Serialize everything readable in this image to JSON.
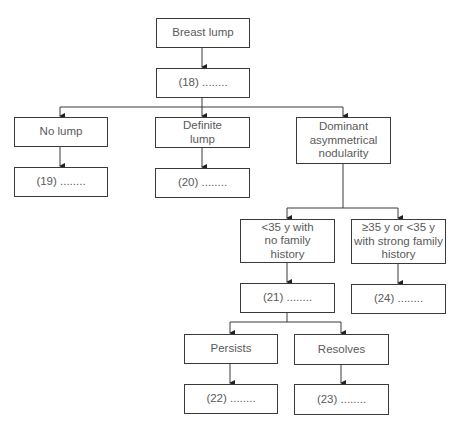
{
  "diagram": {
    "type": "flowchart",
    "colors": {
      "line": "#3a3a3a",
      "text": "#5a5a5a",
      "background": "#ffffff"
    },
    "nodes": {
      "root": {
        "label": "Breast lump"
      },
      "q18": {
        "label": "(18) ........"
      },
      "no_lump": {
        "label": "No lump"
      },
      "definite_lump": {
        "label": "Definite lump"
      },
      "dominant": {
        "label": "Dominant asymmetrical nodularity"
      },
      "q19": {
        "label": "(19) ........"
      },
      "q20": {
        "label": "(20) ........"
      },
      "under35": {
        "label": "<35 y with no family history"
      },
      "over35": {
        "label": "≥35 y or <35 y with strong family history"
      },
      "q21": {
        "label": "(21) ........"
      },
      "q24": {
        "label": "(24) ........"
      },
      "persists": {
        "label": "Persists"
      },
      "resolves": {
        "label": "Resolves"
      },
      "q22": {
        "label": "(22) ........"
      },
      "q23": {
        "label": "(23) ........"
      }
    },
    "edges": [
      [
        "root",
        "q18"
      ],
      [
        "q18",
        "no_lump"
      ],
      [
        "q18",
        "definite_lump"
      ],
      [
        "q18",
        "dominant"
      ],
      [
        "no_lump",
        "q19"
      ],
      [
        "definite_lump",
        "q20"
      ],
      [
        "dominant",
        "under35"
      ],
      [
        "dominant",
        "over35"
      ],
      [
        "under35",
        "q21"
      ],
      [
        "over35",
        "q24"
      ],
      [
        "q21",
        "persists"
      ],
      [
        "q21",
        "resolves"
      ],
      [
        "persists",
        "q22"
      ],
      [
        "resolves",
        "q23"
      ]
    ]
  }
}
